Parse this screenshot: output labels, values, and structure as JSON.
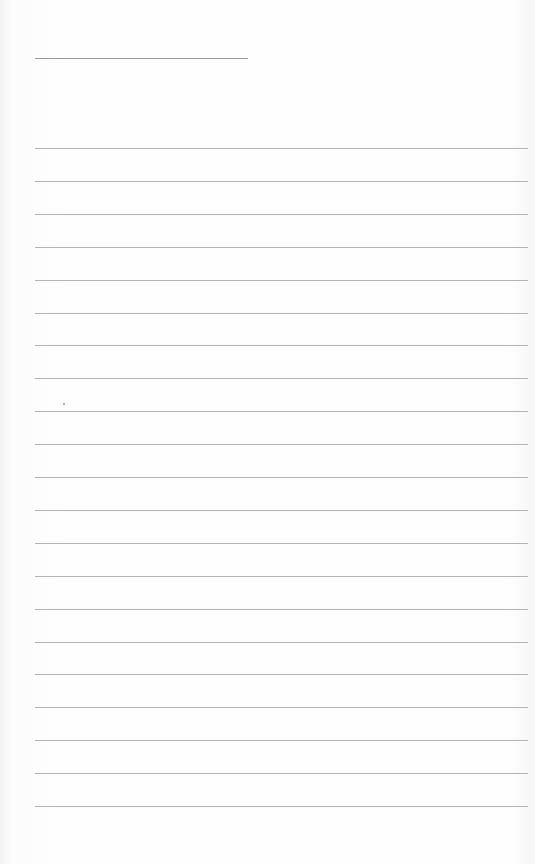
{
  "document": {
    "type": "blank lined sheet",
    "header_line": {
      "x": 35,
      "y": 58,
      "width": 213
    },
    "ruled_lines": {
      "count": 21,
      "start_y": 148,
      "spacing": 32.9,
      "x": 35,
      "width": 493
    },
    "colors": {
      "paper": "#fefefe",
      "line": "#b4b4b4",
      "header_line": "#9a9a9a"
    }
  }
}
